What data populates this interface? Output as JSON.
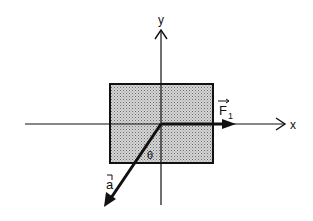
{
  "diagram": {
    "type": "free-body force diagram",
    "axes": {
      "x_label": "x",
      "y_label": "y"
    },
    "body": {
      "shape": "rectangle",
      "fill": "stippled gray"
    },
    "vectors": [
      {
        "id": "F1",
        "label": "F",
        "subscript": "1",
        "direction": "along +x"
      },
      {
        "id": "a",
        "label": "a",
        "direction": "down-left, angle theta from -y axis"
      }
    ],
    "angle_label": "θ",
    "colors": {
      "line": "#111111",
      "body_fill": "#c8c8c8",
      "background": "#ffffff"
    }
  }
}
